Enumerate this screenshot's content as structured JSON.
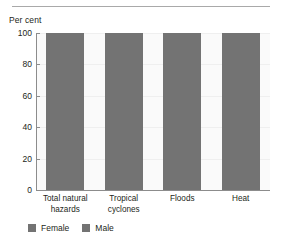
{
  "top_rule": {
    "color": "#a9a9a9"
  },
  "axis_title": "Per cent",
  "legend": {
    "items": [
      {
        "label": "Female",
        "color": "#737373"
      },
      {
        "label": "Male",
        "color": "#737373"
      }
    ]
  },
  "colors": {
    "bar_female": "#737373",
    "bar_male": "#737373",
    "axis": "#8c8c8c",
    "grid": "#efefef",
    "plot_bg": "#fafafa",
    "text": "#231f20"
  },
  "chart_data": {
    "type": "bar",
    "stacked": true,
    "title": "",
    "xlabel": "",
    "ylabel": "Per cent",
    "ylim": [
      0,
      100
    ],
    "yticks": [
      0,
      20,
      40,
      60,
      80,
      100
    ],
    "ytick_labels": [
      "0",
      "20",
      "40",
      "60",
      "80",
      "100"
    ],
    "grid": true,
    "legend_position": "bottom-left",
    "categories": [
      "Total natural hazards",
      "Tropical cyclones",
      "Floods",
      "Heat"
    ],
    "category_lines": [
      [
        "Total natural",
        "hazards"
      ],
      [
        "Tropical",
        "cyclones"
      ],
      [
        "Floods"
      ],
      [
        "Heat"
      ]
    ],
    "series": [
      {
        "name": "Female",
        "values": [
          50,
          50,
          50,
          63
        ],
        "color": "#737373"
      },
      {
        "name": "Male",
        "values": [
          50,
          50,
          50,
          37
        ],
        "color": "#737373"
      }
    ],
    "totals": [
      100,
      100,
      100,
      100
    ]
  }
}
